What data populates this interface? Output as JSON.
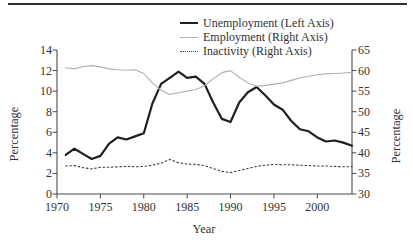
{
  "colors": {
    "background": "#ffffff",
    "axis": "#4a4a4a",
    "text": "#333333",
    "top_rule": "#2e2e2e",
    "unemployment_line": "#1f1f1f",
    "employment_line": "#b0b0b0",
    "inactivity_line": "#3d3d3d"
  },
  "chart_data": {
    "type": "line",
    "xlabel": "Year",
    "ylabel_left": "Percentage",
    "ylabel_right": "Percentage",
    "legend_position": "top",
    "grid": false,
    "xlim": [
      1970,
      2004
    ],
    "left_ylim": [
      0,
      14
    ],
    "right_ylim": [
      30,
      65
    ],
    "x_ticks": [
      1970,
      1975,
      1980,
      1985,
      1990,
      1995,
      2000
    ],
    "left_ticks": [
      0,
      2,
      4,
      6,
      8,
      10,
      12,
      14
    ],
    "right_ticks": [
      30,
      35,
      40,
      45,
      50,
      55,
      60,
      65
    ],
    "years": [
      1971,
      1972,
      1973,
      1974,
      1975,
      1976,
      1977,
      1978,
      1979,
      1980,
      1981,
      1982,
      1983,
      1984,
      1985,
      1986,
      1987,
      1988,
      1989,
      1990,
      1991,
      1992,
      1993,
      1994,
      1995,
      1996,
      1997,
      1998,
      1999,
      2000,
      2001,
      2002,
      2003,
      2004
    ],
    "series": [
      {
        "name": "Unemployment (Left Axis)",
        "axis": "left",
        "color": "#1f1f1f",
        "style": "solid",
        "width": 2.2,
        "values": [
          3.8,
          4.4,
          3.9,
          3.4,
          3.7,
          4.9,
          5.5,
          5.3,
          5.6,
          5.9,
          8.8,
          10.7,
          11.3,
          11.9,
          11.3,
          11.4,
          10.7,
          8.9,
          7.3,
          7.0,
          8.9,
          9.9,
          10.4,
          9.6,
          8.7,
          8.2,
          7.1,
          6.3,
          6.1,
          5.5,
          5.1,
          5.2,
          5.0,
          4.7
        ]
      },
      {
        "name": "Employment (Right Axis)",
        "axis": "right",
        "color": "#b0b0b0",
        "style": "solid",
        "width": 1.1,
        "values": [
          60.7,
          60.4,
          61.0,
          61.2,
          60.9,
          60.4,
          60.2,
          60.1,
          60.2,
          59.3,
          57.0,
          55.2,
          54.2,
          54.6,
          55.0,
          55.4,
          56.3,
          58.0,
          59.5,
          60.0,
          58.4,
          57.0,
          56.2,
          56.4,
          56.7,
          57.0,
          57.6,
          58.2,
          58.6,
          59.0,
          59.2,
          59.3,
          59.4,
          59.6
        ]
      },
      {
        "name": "Inactivity (Right Axis)",
        "axis": "right",
        "color": "#3d3d3d",
        "style": "dotted",
        "width": 1.1,
        "values": [
          36.8,
          36.9,
          36.4,
          36.1,
          36.5,
          36.5,
          36.6,
          36.7,
          36.6,
          36.7,
          37.0,
          37.5,
          38.4,
          37.6,
          37.3,
          37.2,
          36.9,
          36.2,
          35.5,
          35.2,
          35.7,
          36.2,
          36.7,
          37.0,
          37.2,
          37.1,
          37.1,
          37.0,
          36.9,
          36.8,
          36.8,
          36.7,
          36.6,
          36.6
        ]
      }
    ]
  }
}
